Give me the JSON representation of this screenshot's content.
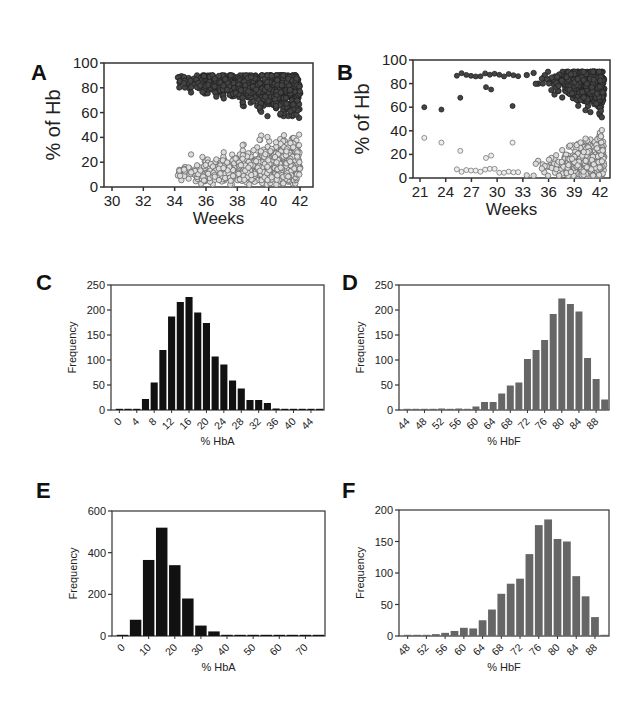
{
  "figure": {
    "panels": [
      "A",
      "B",
      "C",
      "D",
      "E",
      "F"
    ]
  },
  "chart_data": [
    {
      "panel": "A",
      "type": "scatter",
      "title": "",
      "xlabel": "Weeks",
      "ylabel": "% of Hb",
      "xlim": [
        30,
        43
      ],
      "ylim": [
        0,
        100
      ],
      "xticks": [
        30,
        32,
        34,
        36,
        38,
        40,
        42
      ],
      "yticks": [
        0,
        20,
        40,
        60,
        80,
        100
      ],
      "series": [
        {
          "name": "HbF",
          "color": "#555555",
          "description": "dark filled circles",
          "x_range": [
            34,
            42
          ],
          "y_range": [
            48,
            91
          ],
          "center_y": 78
        },
        {
          "name": "HbA",
          "color": "#cccccc",
          "description": "light open circles",
          "x_range": [
            34,
            42
          ],
          "y_range": [
            0,
            46
          ],
          "center_y": 17
        }
      ]
    },
    {
      "panel": "B",
      "type": "scatter",
      "title": "",
      "xlabel": "Weeks",
      "ylabel": "% of Hb",
      "xlim": [
        20,
        43
      ],
      "ylim": [
        0,
        100
      ],
      "xticks": [
        21,
        24,
        27,
        30,
        33,
        36,
        39,
        42
      ],
      "yticks": [
        0,
        20,
        40,
        60,
        80,
        100
      ],
      "series": [
        {
          "name": "HbF",
          "color": "#555555",
          "description": "dark filled circles",
          "x_range": [
            21.5,
            42.5
          ],
          "y_range": [
            49,
            89
          ],
          "outliers": [
            [
              21.5,
              60
            ],
            [
              23.5,
              58
            ],
            [
              25.7,
              68
            ],
            [
              28.7,
              77
            ],
            [
              29.3,
              75
            ],
            [
              31.8,
              61
            ]
          ]
        },
        {
          "name": "HbA",
          "color": "#cccccc",
          "description": "light open circles",
          "x_range": [
            21.5,
            42.5
          ],
          "y_range": [
            2,
            40
          ],
          "outliers": [
            [
              21.5,
              34
            ],
            [
              23.5,
              30
            ],
            [
              25.7,
              23
            ],
            [
              28.7,
              17
            ],
            [
              29.3,
              19
            ],
            [
              31.8,
              30
            ]
          ]
        }
      ]
    },
    {
      "panel": "C",
      "type": "bar",
      "xlabel": "% HbA",
      "ylabel": "Frequency",
      "ylim": [
        0,
        250
      ],
      "yticks": [
        0,
        50,
        100,
        150,
        200,
        250
      ],
      "xtick_labels": [
        "0",
        "4",
        "8",
        "12",
        "16",
        "20",
        "24",
        "28",
        "32",
        "36",
        "40",
        "44"
      ],
      "bar_color": "#111111",
      "categories": [
        0,
        2,
        4,
        6,
        8,
        10,
        12,
        14,
        16,
        18,
        20,
        22,
        24,
        26,
        28,
        30,
        32,
        34,
        36,
        38,
        40,
        42,
        44,
        46
      ],
      "values": [
        2,
        0,
        1,
        22,
        55,
        120,
        187,
        216,
        226,
        195,
        174,
        107,
        91,
        59,
        43,
        20,
        20,
        14,
        3,
        2,
        1,
        1,
        1,
        1
      ]
    },
    {
      "panel": "D",
      "type": "bar",
      "xlabel": "% HbF",
      "ylabel": "Frequency",
      "ylim": [
        0,
        250
      ],
      "yticks": [
        0,
        50,
        100,
        150,
        200,
        250
      ],
      "xtick_labels": [
        "44",
        "48",
        "52",
        "56",
        "60",
        "64",
        "68",
        "72",
        "76",
        "80",
        "84",
        "88"
      ],
      "bar_color": "#666666",
      "categories": [
        44,
        46,
        48,
        50,
        52,
        54,
        56,
        58,
        60,
        62,
        64,
        66,
        68,
        70,
        72,
        74,
        76,
        78,
        80,
        82,
        84,
        86,
        88,
        90
      ],
      "values": [
        1,
        1,
        2,
        2,
        3,
        0,
        3,
        2,
        7,
        16,
        16,
        33,
        49,
        55,
        102,
        120,
        140,
        192,
        223,
        212,
        197,
        104,
        62,
        21
      ]
    },
    {
      "panel": "E",
      "type": "bar",
      "xlabel": "% HbA",
      "ylabel": "Frequency",
      "ylim": [
        0,
        600
      ],
      "yticks": [
        0,
        200,
        400,
        600
      ],
      "xtick_labels": [
        "0",
        "10",
        "20",
        "30",
        "40",
        "50",
        "60",
        "70"
      ],
      "bar_color": "#111111",
      "categories": [
        0,
        5,
        10,
        15,
        20,
        25,
        30,
        35,
        40,
        45,
        50,
        55,
        60,
        65,
        70,
        75
      ],
      "values": [
        2,
        78,
        365,
        520,
        340,
        180,
        50,
        22,
        5,
        1,
        1,
        1,
        1,
        1,
        1,
        2
      ]
    },
    {
      "panel": "F",
      "type": "bar",
      "xlabel": "% HbF",
      "ylabel": "Frequency",
      "ylim": [
        0,
        200
      ],
      "yticks": [
        0,
        50,
        100,
        150,
        200
      ],
      "xtick_labels": [
        "48",
        "52",
        "56",
        "60",
        "64",
        "68",
        "72",
        "76",
        "80",
        "84",
        "88"
      ],
      "bar_color": "#666666",
      "categories": [
        48,
        50,
        52,
        54,
        56,
        58,
        60,
        62,
        64,
        66,
        68,
        70,
        72,
        74,
        76,
        78,
        80,
        82,
        84,
        86,
        88,
        90
      ],
      "values": [
        1,
        1,
        1,
        3,
        5,
        8,
        13,
        12,
        25,
        42,
        67,
        83,
        91,
        130,
        176,
        185,
        154,
        150,
        95,
        63,
        30,
        1
      ]
    }
  ]
}
